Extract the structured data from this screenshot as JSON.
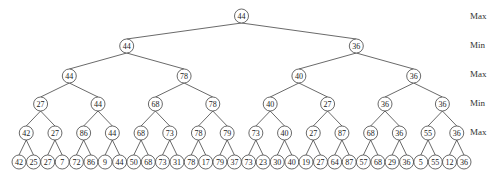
{
  "level_labels": [
    "Max",
    "Min",
    "Max",
    "Min",
    "Max"
  ],
  "tree": {
    "levels": [
      [
        44
      ],
      [
        44,
        36
      ],
      [
        44,
        78,
        40,
        36
      ],
      [
        27,
        44,
        68,
        78,
        40,
        27,
        36,
        36
      ],
      [
        42,
        27,
        86,
        44,
        68,
        73,
        78,
        79,
        73,
        40,
        27,
        87,
        68,
        36,
        55,
        36
      ],
      [
        42,
        25,
        27,
        7,
        72,
        86,
        9,
        44,
        50,
        68,
        73,
        31,
        78,
        17,
        79,
        37,
        73,
        23,
        30,
        40,
        19,
        27,
        64,
        87,
        57,
        68,
        29,
        36,
        5,
        55,
        12,
        36
      ]
    ]
  }
}
